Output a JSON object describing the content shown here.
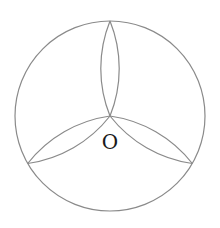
{
  "diagram": {
    "type": "geometry",
    "center_label": "O",
    "circle": {
      "cx": 110,
      "cy": 116,
      "r": 95
    },
    "lens_endpoints": [
      {
        "x": 110,
        "y": 21
      },
      {
        "x": 27.7,
        "y": 163.5
      },
      {
        "x": 192.3,
        "y": 163.5
      }
    ],
    "lens_arc_radius": 127,
    "stroke_color": "#8a8a8a",
    "label_color": "#1a1a1a"
  }
}
